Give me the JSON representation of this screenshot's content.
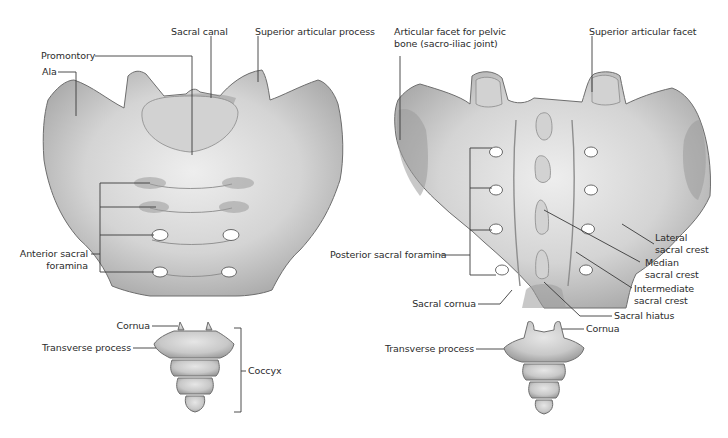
{
  "figure": {
    "views": [
      {
        "id": "anterior",
        "labels": {
          "sacral_canal": "Sacral canal",
          "superior_articular_process": "Superior articular process",
          "promontory": "Promontory",
          "ala": "Ala",
          "anterior_sacral_foramina_line1": "Anterior sacral",
          "anterior_sacral_foramina_line2": "foramina",
          "cornua": "Cornua",
          "transverse_process": "Transverse process",
          "coccyx": "Coccyx"
        }
      },
      {
        "id": "posterior",
        "labels": {
          "articular_facet_line1": "Articular facet for pelvic",
          "articular_facet_line2": "bone (sacro-iliac joint)",
          "superior_articular_facet": "Superior articular facet",
          "posterior_sacral_foramina": "Posterior sacral foramina",
          "lateral_sacral_crest_line1": "Lateral",
          "lateral_sacral_crest_line2": "sacral crest",
          "median_sacral_crest_line1": "Median",
          "median_sacral_crest_line2": "sacral crest",
          "intermediate_sacral_crest_line1": "Intermediate",
          "intermediate_sacral_crest_line2": "sacral crest",
          "sacral_cornua": "Sacral cornua",
          "sacral_hiatus": "Sacral hiatus",
          "cornua": "Cornua",
          "transverse_process": "Transverse process"
        }
      }
    ],
    "colors": {
      "background": "#ffffff",
      "bone_light": "#e4e4e4",
      "bone_dark": "#a8a8a8",
      "outline": "#6e6e6e",
      "leader_line": "#3a3a3a",
      "label_text": "#2b2b2b"
    }
  }
}
